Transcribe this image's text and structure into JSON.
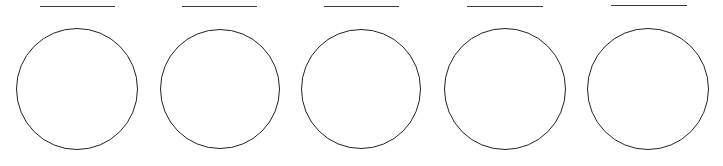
{
  "worksheet": {
    "items": [
      {
        "label": "",
        "line": {
          "x1": 40,
          "x2": 115,
          "y": 6
        },
        "circle": {
          "cx": 77,
          "cy": 88.5,
          "r": 61
        }
      },
      {
        "label": "",
        "line": {
          "x1": 182,
          "x2": 257,
          "y": 6
        },
        "circle": {
          "cx": 220,
          "cy": 88.5,
          "r": 60
        }
      },
      {
        "label": "",
        "line": {
          "x1": 324,
          "x2": 399,
          "y": 6
        },
        "circle": {
          "cx": 361,
          "cy": 88.5,
          "r": 60
        }
      },
      {
        "label": "",
        "line": {
          "x1": 467,
          "x2": 543,
          "y": 6
        },
        "circle": {
          "cx": 505,
          "cy": 88.5,
          "r": 61
        }
      },
      {
        "label": "",
        "line": {
          "x1": 611,
          "x2": 687,
          "y": 5
        },
        "circle": {
          "cx": 648,
          "cy": 88.5,
          "r": 61
        }
      }
    ]
  },
  "colors": {
    "background": "#ffffff",
    "stroke": "#222222",
    "line": "#3a3a3a"
  }
}
